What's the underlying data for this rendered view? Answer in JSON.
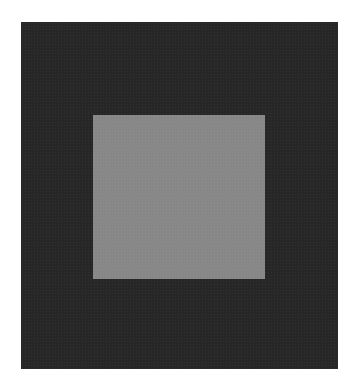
{
  "image": {
    "description": "Gray square centered-upper within a larger dark charcoal square on white background",
    "background_color": "#ffffff",
    "outer_square": {
      "color": "#2c2c2c",
      "x": 21,
      "y": 22,
      "width": 317,
      "height": 347
    },
    "inner_square": {
      "color": "#8c8c8c",
      "x": 93,
      "y": 115,
      "width": 172,
      "height": 164
    }
  }
}
